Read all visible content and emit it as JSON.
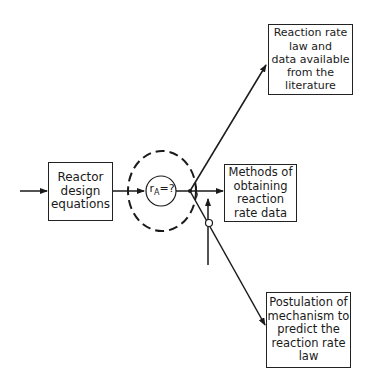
{
  "diagram": {
    "nodes": {
      "reactor": {
        "lines": [
          "Reactor",
          "design",
          "equations"
        ]
      },
      "rate_unknown": {
        "symbol": "r",
        "subscript": "A",
        "suffix": "=?"
      },
      "literature": {
        "lines": [
          "Reaction rate",
          "law and",
          "data available",
          "from the",
          "literature"
        ]
      },
      "methods": {
        "lines": [
          "Methods of",
          "obtaining",
          "reaction",
          "rate data"
        ]
      },
      "mechanism": {
        "lines": [
          "Postulation of",
          "mechanism to",
          "predict the",
          "reaction rate",
          "law"
        ]
      }
    },
    "edges": [
      {
        "from": "input",
        "to": "reactor"
      },
      {
        "from": "reactor",
        "to": "rate_unknown"
      },
      {
        "from": "rate_unknown",
        "to": "literature"
      },
      {
        "from": "rate_unknown",
        "to": "methods"
      },
      {
        "from": "rate_unknown",
        "to": "mechanism"
      },
      {
        "from": "external",
        "to": "methods-path"
      }
    ],
    "colors": {
      "line": "#1a1a1a",
      "background": "#ffffff"
    }
  }
}
